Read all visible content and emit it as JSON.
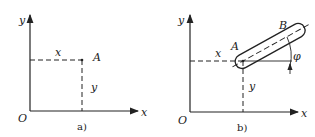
{
  "panels": [
    {
      "id": "a",
      "caption": "a)",
      "labels": {
        "y_axis": "y",
        "x_axis": "x",
        "origin": "O",
        "x_coord": "x",
        "y_coord": "y",
        "point": "A"
      }
    },
    {
      "id": "b",
      "caption": "b)",
      "labels": {
        "y_axis": "y",
        "x_axis": "x",
        "origin": "O",
        "x_coord": "x",
        "y_coord": "y",
        "point_a": "A",
        "point_b": "B",
        "angle": "φ"
      }
    }
  ],
  "colors": {
    "line": "#222222",
    "background": "#ffffff"
  }
}
